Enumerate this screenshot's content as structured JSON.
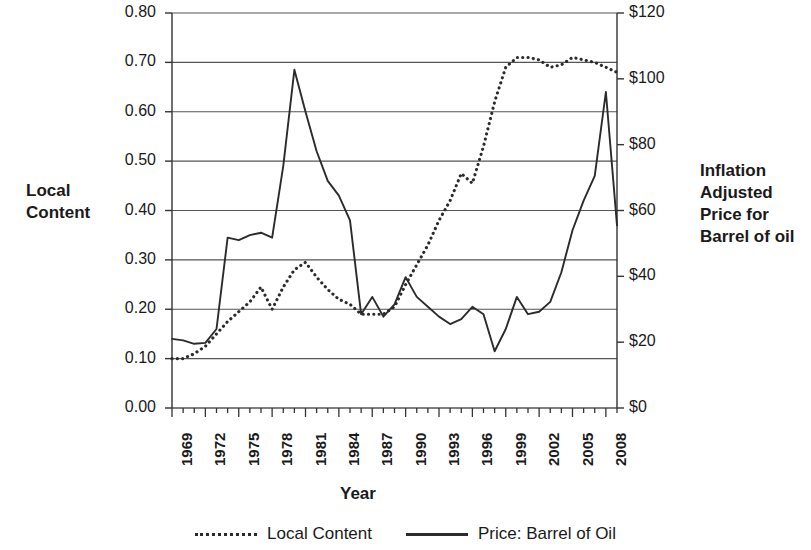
{
  "chart_data": {
    "type": "line",
    "title": "",
    "xlabel": "Year",
    "ylabel_left": "Local Content",
    "ylabel_right": "Inflation Adjusted Price for Barrel of oil",
    "grid": true,
    "legend_position": "bottom",
    "x": [
      1969,
      1970,
      1971,
      1972,
      1973,
      1974,
      1975,
      1976,
      1977,
      1978,
      1979,
      1980,
      1981,
      1982,
      1983,
      1984,
      1985,
      1986,
      1987,
      1988,
      1989,
      1990,
      1991,
      1992,
      1993,
      1994,
      1995,
      1996,
      1997,
      1998,
      1999,
      2000,
      2001,
      2002,
      2003,
      2004,
      2005,
      2006,
      2007,
      2008,
      2009
    ],
    "x_tick_labels": [
      "1969",
      "1972",
      "1975",
      "1978",
      "1981",
      "1984",
      "1987",
      "1990",
      "1993",
      "1996",
      "1999",
      "2002",
      "2005",
      "2008"
    ],
    "y_left_ticks": [
      "0.00",
      "0.10",
      "0.20",
      "0.30",
      "0.40",
      "0.50",
      "0.60",
      "0.70",
      "0.80"
    ],
    "y_right_ticks": [
      "$0",
      "$20",
      "$40",
      "$60",
      "$80",
      "$100",
      "$120"
    ],
    "ylim_left": [
      0.0,
      0.8
    ],
    "ylim_right": [
      0,
      120
    ],
    "series": [
      {
        "name": "Local Content",
        "style": "dotted",
        "axis": "left",
        "color": "#2b2b2b",
        "values": [
          0.1,
          0.1,
          0.11,
          0.125,
          0.15,
          0.175,
          0.195,
          0.215,
          0.245,
          0.2,
          0.245,
          0.28,
          0.295,
          0.265,
          0.24,
          0.22,
          0.21,
          0.19,
          0.19,
          0.19,
          0.205,
          0.25,
          0.29,
          0.33,
          0.38,
          0.42,
          0.475,
          0.455,
          0.53,
          0.62,
          0.69,
          0.71,
          0.71,
          0.705,
          0.69,
          0.695,
          0.71,
          0.705,
          0.7,
          0.69,
          0.68
        ]
      },
      {
        "name": "Price: Barrel of Oil",
        "style": "solid",
        "axis": "right",
        "color": "#2b2b2b",
        "values": [
          0.14,
          0.137,
          0.13,
          0.132,
          0.16,
          0.345,
          0.34,
          0.35,
          0.355,
          0.345,
          0.49,
          0.685,
          0.6,
          0.52,
          0.46,
          0.43,
          0.38,
          0.19,
          0.225,
          0.185,
          0.21,
          0.265,
          0.225,
          0.205,
          0.185,
          0.17,
          0.18,
          0.205,
          0.19,
          0.115,
          0.16,
          0.225,
          0.19,
          0.195,
          0.215,
          0.275,
          0.36,
          0.42,
          0.47,
          0.64,
          0.37
        ]
      }
    ]
  },
  "axis_titles": {
    "left": "Local\nContent",
    "right": "Inflation\nAdjusted\nPrice for\nBarrel of oil",
    "bottom": "Year"
  },
  "legend": {
    "entries": [
      {
        "label": "Local Content",
        "style": "dotted"
      },
      {
        "label": "Price: Barrel of Oil",
        "style": "solid"
      }
    ]
  }
}
